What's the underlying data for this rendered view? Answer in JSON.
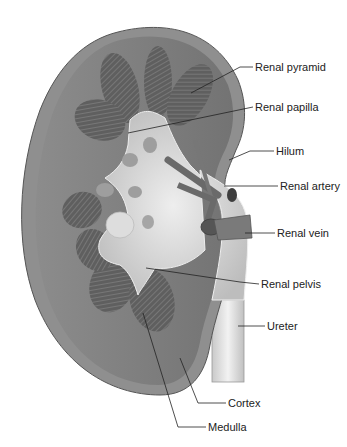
{
  "diagram": {
    "labels": [
      {
        "id": "renal-pyramid",
        "text": "Renal pyramid",
        "x": 255,
        "y": 63
      },
      {
        "id": "renal-papilla",
        "text": "Renal papilla",
        "x": 255,
        "y": 103
      },
      {
        "id": "hilum",
        "text": "Hilum",
        "x": 276,
        "y": 149
      },
      {
        "id": "renal-artery",
        "text": "Renal artery",
        "x": 280,
        "y": 182
      },
      {
        "id": "renal-vein",
        "text": "Renal vein",
        "x": 277,
        "y": 229
      },
      {
        "id": "renal-pelvis",
        "text": "Renal pelvis",
        "x": 261,
        "y": 280
      },
      {
        "id": "ureter",
        "text": "Ureter",
        "x": 267,
        "y": 322
      },
      {
        "id": "cortex",
        "text": "Cortex",
        "x": 228,
        "y": 399
      },
      {
        "id": "medulla",
        "text": "Medulla",
        "x": 208,
        "y": 423
      }
    ],
    "colors": {
      "capsule": "#8a8a8a",
      "cortex": "#7d7d7d",
      "pyramid": "#5a5a5a",
      "pelvis": "#cfcfcf",
      "vessel": "#6f6f6f",
      "ureter": "#dcdcdc",
      "leader": "#222222"
    }
  }
}
